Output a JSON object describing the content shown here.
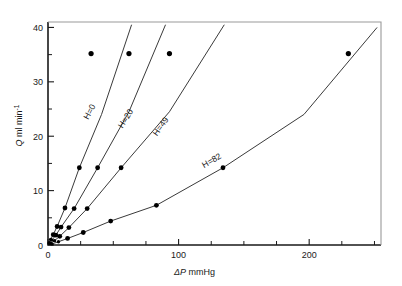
{
  "chart_data": {
    "type": "line",
    "title": "",
    "xlabel": "ΔP mmHg",
    "ylabel": "Q ml min⁻¹",
    "ylabel_base": "Q ml min",
    "ylabel_exp": "-1",
    "xlim": [
      0,
      255
    ],
    "ylim": [
      0,
      41
    ],
    "grid": false,
    "legend_position": "inline-curve-labels",
    "x_ticks_major": [
      0,
      100,
      200
    ],
    "x_ticks_major_labels": [
      "0",
      "100",
      "200"
    ],
    "x_ticks_minor": [
      25,
      50,
      75,
      125,
      150,
      175,
      225,
      250
    ],
    "y_ticks_major": [
      0,
      10,
      20,
      30,
      40
    ],
    "y_ticks_major_labels": [
      "0",
      "10",
      "20",
      "30",
      "40"
    ],
    "y_ticks_minor": [
      5,
      15,
      25,
      35
    ],
    "series": [
      {
        "name": "H=0",
        "label": "H=0",
        "x": [
          1,
          2,
          4,
          7,
          13,
          24,
          41,
          64
        ],
        "y": [
          0.4,
          1.0,
          1.9,
          3.4,
          6.8,
          14.2,
          24.0,
          40.5
        ],
        "marker_x": [
          1,
          2,
          4,
          7,
          13,
          24
        ],
        "marker_y": [
          0.4,
          1.0,
          1.9,
          3.4,
          6.8,
          14.2
        ],
        "top_marker_x": 33,
        "top_marker_y": 35.2
      },
      {
        "name": "H=20",
        "label": "H=20",
        "x": [
          1,
          3,
          6,
          10,
          20,
          38,
          62,
          90
        ],
        "y": [
          0.3,
          0.9,
          1.8,
          3.3,
          6.7,
          14.2,
          24.5,
          40.5
        ],
        "marker_x": [
          1,
          3,
          6,
          10,
          20,
          38
        ],
        "marker_y": [
          0.3,
          0.9,
          1.8,
          3.3,
          6.7,
          14.2
        ],
        "top_marker_x": 62,
        "top_marker_y": 35.2
      },
      {
        "name": "H=49",
        "label": "H=49",
        "x": [
          2,
          5,
          9,
          16,
          30,
          56,
          93,
          135
        ],
        "y": [
          0.3,
          0.8,
          1.6,
          3.2,
          6.7,
          14.2,
          24.5,
          40.5
        ],
        "marker_x": [
          2,
          5,
          9,
          16,
          30,
          56
        ],
        "marker_y": [
          0.3,
          0.8,
          1.6,
          3.2,
          6.7,
          14.2
        ],
        "top_marker_x": 93,
        "top_marker_y": 35.2
      },
      {
        "name": "H=82",
        "label": "H=82",
        "x": [
          3,
          8,
          15,
          27,
          48,
          83,
          134,
          196,
          252
        ],
        "y": [
          0.2,
          0.6,
          1.2,
          2.3,
          4.4,
          7.3,
          14.2,
          24.0,
          40.0
        ],
        "marker_x": [
          3,
          8,
          15,
          27,
          48,
          83,
          134
        ],
        "marker_y": [
          0.2,
          0.6,
          1.2,
          2.3,
          4.4,
          7.3,
          14.2
        ],
        "top_marker_x": 230,
        "top_marker_y": 35.2
      }
    ],
    "colors": {
      "axis": "#1a1a1a",
      "curve": "#3a3a3a",
      "marker": "#000000",
      "background": "#ffffff"
    }
  }
}
